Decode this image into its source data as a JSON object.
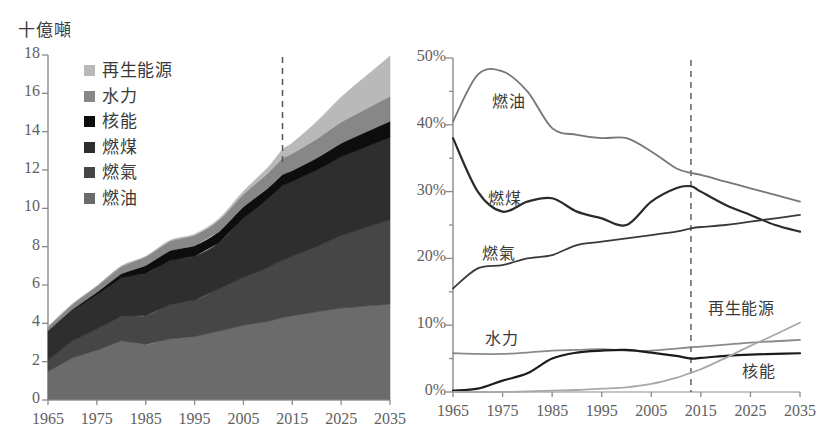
{
  "figure": {
    "background": "#ffffff",
    "xticks": [
      1965,
      1975,
      1985,
      1995,
      2005,
      2015,
      2025,
      2035
    ],
    "xlim": [
      1965,
      2035
    ],
    "forecast_divider_year": 2013
  },
  "left_chart": {
    "axis_title": "十億噸",
    "yticks": [
      "0",
      "2",
      "4",
      "6",
      "8",
      "10",
      "12",
      "14",
      "16",
      "18"
    ],
    "xtick_labels": [
      "1965",
      "1975",
      "1985",
      "1995",
      "2005",
      "2015",
      "2025",
      "2035"
    ],
    "legend": [
      {
        "label": "再生能源",
        "color": "#b9b9b9"
      },
      {
        "label": "水力",
        "color": "#878787"
      },
      {
        "label": "核能",
        "color": "#0d0d0d"
      },
      {
        "label": "燃煤",
        "color": "#2e2e2e"
      },
      {
        "label": "燃氣",
        "color": "#464646"
      },
      {
        "label": "燃油",
        "color": "#6b6b6b"
      }
    ]
  },
  "right_chart": {
    "yticks": [
      "0%",
      "10%",
      "20%",
      "30%",
      "40%",
      "50%"
    ],
    "xtick_labels": [
      "1965",
      "1975",
      "1985",
      "1995",
      "2005",
      "2015",
      "2025",
      "2035"
    ],
    "series_labels": [
      {
        "label": "燃油",
        "x": 492,
        "y": 88
      },
      {
        "label": "燃煤",
        "x": 488,
        "y": 185
      },
      {
        "label": "燃氣",
        "x": 482,
        "y": 240
      },
      {
        "label": "水力",
        "x": 485,
        "y": 325
      },
      {
        "label": "再生能源",
        "x": 708,
        "y": 295
      },
      {
        "label": "核能",
        "x": 742,
        "y": 358
      }
    ]
  },
  "chart_data": [
    {
      "type": "area",
      "id": "left-stacked-area",
      "title": "十億噸",
      "xlabel": "",
      "ylabel": "十億噸",
      "xlim": [
        1965,
        2035
      ],
      "ylim": [
        0,
        18
      ],
      "ytick_step": 2,
      "grid": false,
      "legend_position": "upper-left-inside",
      "stack_order_bottom_to_top": [
        "燃油",
        "燃氣",
        "燃煤",
        "核能",
        "水力",
        "再生能源"
      ],
      "x": [
        1965,
        1970,
        1975,
        1980,
        1985,
        1990,
        1995,
        2000,
        2005,
        2010,
        2013,
        2015,
        2020,
        2025,
        2030,
        2035
      ],
      "series": [
        {
          "name": "燃油",
          "color": "#6b6b6b",
          "values": [
            1.5,
            2.2,
            2.6,
            3.1,
            2.9,
            3.2,
            3.3,
            3.6,
            3.9,
            4.1,
            4.3,
            4.4,
            4.6,
            4.8,
            4.9,
            5.0
          ]
        },
        {
          "name": "燃氣",
          "color": "#464646",
          "values": [
            0.6,
            0.9,
            1.1,
            1.3,
            1.5,
            1.8,
            1.9,
            2.2,
            2.5,
            2.8,
            3.0,
            3.1,
            3.4,
            3.8,
            4.1,
            4.4
          ]
        },
        {
          "name": "燃煤",
          "color": "#2e2e2e",
          "values": [
            1.5,
            1.6,
            1.8,
            2.0,
            2.2,
            2.3,
            2.3,
            2.4,
            3.1,
            3.6,
            3.9,
            3.9,
            4.0,
            4.1,
            4.2,
            4.3
          ]
        },
        {
          "name": "核能",
          "color": "#0d0d0d",
          "values": [
            0.01,
            0.03,
            0.12,
            0.19,
            0.42,
            0.5,
            0.55,
            0.58,
            0.58,
            0.55,
            0.56,
            0.57,
            0.62,
            0.7,
            0.78,
            0.85
          ]
        },
        {
          "name": "水力",
          "color": "#878787",
          "values": [
            0.21,
            0.27,
            0.32,
            0.38,
            0.45,
            0.5,
            0.55,
            0.6,
            0.66,
            0.78,
            0.86,
            0.89,
            1.0,
            1.1,
            1.2,
            1.3
          ]
        },
        {
          "name": "再生能源",
          "color": "#b9b9b9",
          "values": [
            0.0,
            0.0,
            0.0,
            0.01,
            0.02,
            0.03,
            0.05,
            0.08,
            0.15,
            0.3,
            0.45,
            0.55,
            0.9,
            1.3,
            1.7,
            2.1
          ]
        }
      ],
      "total": [
        3.8,
        5.0,
        5.9,
        7.0,
        7.5,
        8.3,
        8.6,
        9.5,
        10.9,
        12.1,
        13.1,
        13.5,
        14.5,
        15.8,
        16.9,
        18.0
      ]
    },
    {
      "type": "line",
      "id": "right-share-lines",
      "title": "",
      "xlabel": "",
      "ylabel": "%",
      "xlim": [
        1965,
        2035
      ],
      "ylim": [
        0,
        50
      ],
      "ytick_step": 10,
      "minor_ytick_step": 5,
      "grid": false,
      "legend_position": "inline-labels",
      "x": [
        1965,
        1970,
        1975,
        1980,
        1985,
        1990,
        1995,
        2000,
        2005,
        2010,
        2013,
        2015,
        2020,
        2025,
        2030,
        2035
      ],
      "series": [
        {
          "name": "燃油",
          "color": "#777777",
          "values": [
            40.5,
            47.5,
            48.0,
            45.0,
            39.5,
            38.5,
            38.0,
            38.0,
            36.0,
            33.5,
            32.8,
            32.5,
            31.5,
            30.5,
            29.5,
            28.5
          ]
        },
        {
          "name": "燃煤",
          "color": "#2a2a2a",
          "values": [
            38.0,
            30.0,
            27.0,
            28.5,
            29.0,
            27.0,
            26.0,
            25.0,
            28.5,
            30.5,
            30.8,
            30.0,
            28.0,
            26.5,
            25.0,
            24.0
          ]
        },
        {
          "name": "燃氣",
          "color": "#3a3a3a",
          "values": [
            15.5,
            18.5,
            19.0,
            20.0,
            20.5,
            22.0,
            22.5,
            23.0,
            23.5,
            24.0,
            24.5,
            24.7,
            25.0,
            25.5,
            26.0,
            26.5
          ]
        },
        {
          "name": "水力",
          "color": "#8a8a8a",
          "values": [
            5.8,
            5.7,
            5.7,
            5.9,
            6.2,
            6.3,
            6.4,
            6.2,
            6.2,
            6.5,
            6.7,
            6.8,
            7.1,
            7.4,
            7.6,
            7.8
          ]
        },
        {
          "name": "核能",
          "color": "#1c1c1c",
          "values": [
            0.2,
            0.5,
            1.7,
            2.8,
            5.0,
            5.9,
            6.2,
            6.3,
            5.9,
            5.4,
            5.0,
            5.1,
            5.4,
            5.6,
            5.7,
            5.8
          ]
        },
        {
          "name": "再生能源",
          "color": "#a8a8a8",
          "values": [
            0.0,
            0.0,
            0.0,
            0.1,
            0.2,
            0.3,
            0.5,
            0.7,
            1.2,
            2.1,
            2.9,
            3.4,
            5.1,
            6.9,
            8.6,
            10.4
          ]
        }
      ]
    }
  ]
}
